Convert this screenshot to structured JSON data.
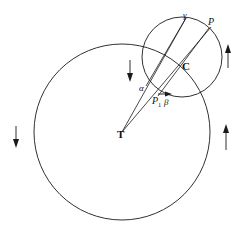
{
  "figure": {
    "type": "geometry-diagram",
    "background_color": "#ffffff",
    "stroke_color": "#1a1a1a",
    "width": 250,
    "height": 238,
    "labels": {
      "gamma": "γ",
      "p": "P",
      "c": "C",
      "alpha": "α",
      "p1_base": "P",
      "p1_sub": "1",
      "beta": "β",
      "t": "T"
    },
    "circles": [
      {
        "name": "large-circle",
        "center_x": 122,
        "center_y": 132,
        "radius": 88
      },
      {
        "name": "small-circle",
        "center_x": 182,
        "center_y": 57,
        "radius": 40
      }
    ],
    "points": {
      "T": {
        "x": 122,
        "y": 132
      },
      "C": {
        "x": 182,
        "y": 57
      },
      "gamma": {
        "x": 185,
        "y": 19
      },
      "P": {
        "x": 208,
        "y": 28
      },
      "P1": {
        "x": 160,
        "y": 96
      },
      "alpha": {
        "x": 148,
        "y": 88
      }
    },
    "rays": [
      {
        "name": "ray-T-gamma",
        "x1": 122,
        "y1": 132,
        "x2": 186,
        "y2": 19
      },
      {
        "name": "ray-T-P",
        "x1": 122,
        "y1": 132,
        "x2": 210,
        "y2": 28
      }
    ],
    "arrows": [
      {
        "name": "arrow-outer-left-down",
        "x": 16,
        "y1": 126,
        "y2": 147,
        "direction": "down"
      },
      {
        "name": "arrow-outer-right-up",
        "x": 226,
        "y1": 150,
        "y2": 125,
        "direction": "up"
      },
      {
        "name": "arrow-upper-right-up",
        "x": 228,
        "y1": 68,
        "y2": 45,
        "direction": "up"
      },
      {
        "name": "arrow-inner-down",
        "x": 130,
        "y1": 60,
        "y2": 81,
        "direction": "down"
      },
      {
        "name": "arrow-beta-right",
        "x1": 158,
        "y1": 94,
        "x2": 170,
        "y2": 94,
        "direction": "right"
      }
    ]
  }
}
